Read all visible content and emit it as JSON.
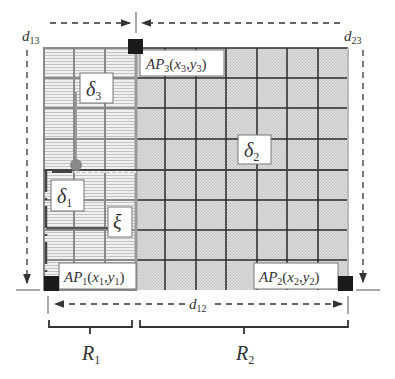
{
  "diagram": {
    "regions": [
      {
        "id": "R1",
        "label": "R",
        "sub": "1",
        "columns": 3,
        "rows": 8,
        "fill": "#ececec",
        "texture": "horizontal-lines"
      },
      {
        "id": "R2",
        "label": "R",
        "sub": "2",
        "columns": 7,
        "rows": 8,
        "fill": "#d8d8d8",
        "texture": "dotted"
      }
    ],
    "access_points": [
      {
        "id": "AP1",
        "prefix": "AP",
        "idx": "1",
        "coords_x": "x",
        "coords_y": "y",
        "corner": "bottom-left"
      },
      {
        "id": "AP2",
        "prefix": "AP",
        "idx": "2",
        "coords_x": "x",
        "coords_y": "y",
        "corner": "bottom-right"
      },
      {
        "id": "AP3",
        "prefix": "AP",
        "idx": "3",
        "coords_x": "x",
        "coords_y": "y",
        "corner": "top-boundary"
      }
    ],
    "distances": [
      {
        "id": "d12",
        "label": "d",
        "sub": "12"
      },
      {
        "id": "d13",
        "label": "d",
        "sub": "13"
      },
      {
        "id": "d23",
        "label": "d",
        "sub": "23"
      }
    ],
    "deltas": [
      {
        "id": "delta1",
        "label": "δ",
        "sub": "1"
      },
      {
        "id": "delta2",
        "label": "δ",
        "sub": "2"
      },
      {
        "id": "delta3",
        "label": "δ",
        "sub": "3"
      }
    ],
    "xi": {
      "label": "ξ"
    },
    "colors": {
      "grid_dark": "#2a2a2a",
      "grid_light": "#8a8a8a",
      "ap_marker": "#1a1a1a",
      "point_marker": "#888888",
      "dashed": "#333333"
    }
  }
}
